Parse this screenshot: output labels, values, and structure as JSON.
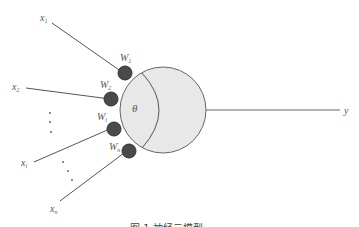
{
  "diagram": {
    "colors": {
      "line": "#555555",
      "neuron_fill": "#e8e8e8",
      "neuron_stroke": "#666666",
      "weight_fill": "#4a4a4a",
      "weight_stroke": "#333333",
      "text": "#555555"
    },
    "inputs": [
      {
        "label": "x",
        "sub": "1",
        "weight": "W",
        "weight_sub": "1"
      },
      {
        "label": "x",
        "sub": "2",
        "weight": "W",
        "weight_sub": "2"
      },
      {
        "label": "x",
        "sub": "i",
        "weight": "W",
        "weight_sub": "i"
      },
      {
        "label": "x",
        "sub": "n",
        "weight": "W",
        "weight_sub": "n"
      }
    ],
    "threshold_label": "θ",
    "output_label": "y",
    "ellipsis": "⋮",
    "caption": "图 1  神经元模型"
  }
}
